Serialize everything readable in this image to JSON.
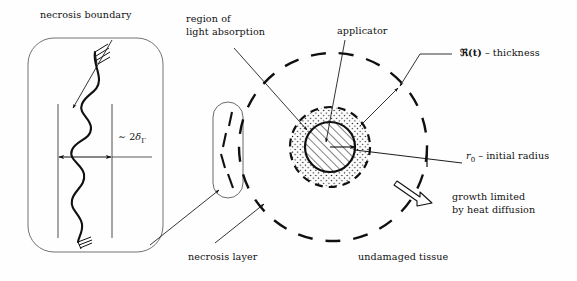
{
  "figure": {
    "type": "diagram",
    "background_color": "#fefefe",
    "ink_color": "#101010"
  },
  "labels": {
    "necrosis_boundary": "necrosis boundary",
    "region_of_light_absorption_line1": "region of",
    "region_of_light_absorption_line2": "light absorption",
    "applicator": "applicator",
    "thickness_symbol": "ℜ(t)",
    "thickness_dash": "–",
    "thickness_word": "thickness",
    "initial_radius_symbol": "r",
    "initial_radius_sub": "0",
    "initial_radius_dash": "–",
    "initial_radius_word": "initial radius",
    "growth_limited_line1": "growth limited",
    "growth_limited_line2": "by heat diffusion",
    "necrosis_layer": "necrosis layer",
    "undamaged_tissue": "undamaged tissue",
    "delta_tilde": "∼",
    "delta_two": "2",
    "delta_symbol": "δ",
    "delta_sub": "Γ"
  },
  "shapes": {
    "inset_frame": {
      "name": "magnified-necrosis-boundary-inset",
      "x": 28,
      "y": 38,
      "width": 135,
      "height": 214,
      "corner_radius": 26
    },
    "necrosis_capsule": {
      "name": "necrosis-layer-capsule",
      "cx": 228,
      "cy": 150,
      "width": 30,
      "height": 96,
      "corner_radius": 15
    },
    "applicator_circle": {
      "name": "applicator-hatched-circle",
      "cx": 330,
      "cy": 147,
      "r": 25,
      "fill": "diagonal-hatch"
    },
    "absorption_ring": {
      "name": "light-absorption-dotted-ring",
      "cx": 330,
      "cy": 147,
      "r": 40,
      "fill": "stipple-dots",
      "stroke": "dashed"
    },
    "outer_dashed_circle": {
      "name": "necrosis-front-dashed-circle",
      "cx": 333,
      "cy": 147,
      "r": 94,
      "stroke": "dashed"
    },
    "radius_arrow": {
      "name": "initial-radius-arrow",
      "from": [
        330,
        147
      ],
      "to": [
        353,
        147
      ]
    },
    "growth_arrow": {
      "name": "growth-direction-hollow-arrow",
      "from": [
        396,
        182
      ],
      "to": [
        427,
        205
      ]
    },
    "scale_arrow": {
      "name": "necrosis-thickness-double-arrow",
      "y": 157,
      "x1": 58,
      "x2": 112
    },
    "guide_lines": {
      "name": "inset-vertical-guide-lines",
      "x1": 58,
      "x2": 112,
      "y_top": 104,
      "y_bottom": 238
    }
  }
}
